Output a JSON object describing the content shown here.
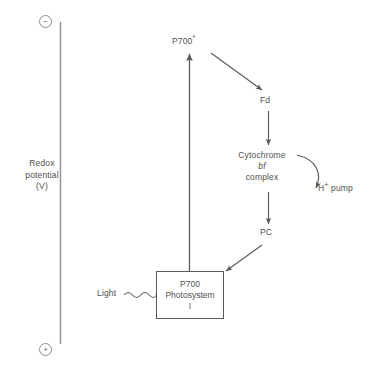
{
  "diagram": {
    "axis": {
      "label_line1": "Redox",
      "label_line2": "potential",
      "label_line3": "(V)",
      "negative_sign": "−",
      "positive_sign": "+",
      "top_end_name": "negative-end",
      "bottom_end_name": "positive-end",
      "line_color": "#8e8e8e"
    },
    "nodes": {
      "p700_excited": {
        "text": "P700",
        "superscript": "*"
      },
      "fd": {
        "text": "Fd"
      },
      "cytochrome": {
        "line1": "Cytochrome",
        "line2": "bf",
        "line3": "complex"
      },
      "h_pump": {
        "text": "H",
        "superscript": "+",
        "suffix": " pump"
      },
      "pc": {
        "text": "PC"
      },
      "light": {
        "text": "Light"
      },
      "photosystem_box": {
        "line1": "P700",
        "line2": "Photosystem",
        "line3": "I"
      }
    },
    "arrows": [
      {
        "name": "arrow-p700-excited-to-fd",
        "from": "P700*",
        "to": "Fd",
        "style": "straight"
      },
      {
        "name": "arrow-fd-to-cytochrome",
        "from": "Fd",
        "to": "Cytochrome bf complex",
        "style": "straight"
      },
      {
        "name": "arrow-cytochrome-to-hpump",
        "from": "Cytochrome bf complex",
        "to": "H+ pump",
        "style": "curved"
      },
      {
        "name": "arrow-cytochrome-to-pc",
        "from": "Cytochrome bf complex",
        "to": "PC",
        "style": "straight"
      },
      {
        "name": "arrow-pc-to-photosystem",
        "from": "PC",
        "to": "P700 Photosystem I",
        "style": "straight"
      },
      {
        "name": "arrow-photosystem-to-p700-excited",
        "from": "P700 Photosystem I",
        "to": "P700*",
        "style": "straight"
      },
      {
        "name": "arrow-light-to-photosystem",
        "from": "Light",
        "to": "P700 Photosystem I",
        "style": "wavy"
      }
    ],
    "colors": {
      "stroke": "#5a5a5a",
      "text": "#4f4f4f",
      "axis": "#8e8e8e",
      "background": "#ffffff"
    }
  }
}
